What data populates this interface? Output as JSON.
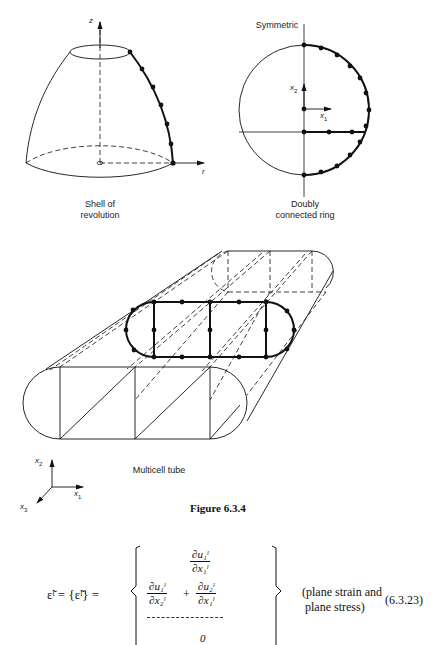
{
  "figure": {
    "panels": {
      "shell": {
        "label_line1": "Shell of",
        "label_line2": "revolution",
        "axis_z": "z",
        "axis_r": "r"
      },
      "ring": {
        "top_label": "Symmetric",
        "label_line1": "Doubly",
        "label_line2": "connected ring",
        "axis_x1": "x",
        "axis_x1_sub": "1",
        "axis_x2": "x",
        "axis_x2_sub": "2"
      },
      "tube": {
        "label": "Multicell tube",
        "axis_x1": "x",
        "axis_x1_sub": "1",
        "axis_x2": "x",
        "axis_x2_sub": "2",
        "axis_x3": "x",
        "axis_x3_sub": "3"
      }
    },
    "caption": "Figure 6.3.4"
  },
  "equation": {
    "lhs": "ε̃ˡ = {ε̃ˡ} =",
    "row1": {
      "num": "∂u₁ˡ",
      "den": "∂x₁ˡ"
    },
    "row2": {
      "a_num": "∂u₁ˡ",
      "a_den": "∂x₂ˡ",
      "plus": "+",
      "b_num": "∂u₂ˡ",
      "b_den": "∂x₁ˡ"
    },
    "row3": "0",
    "note_line1": "(plane strain and",
    "note_line2": " plane stress)",
    "number": "(6.3.23)"
  }
}
